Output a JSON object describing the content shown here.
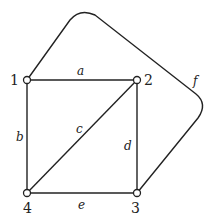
{
  "graph": {
    "nodes": [
      {
        "id": "1",
        "label": "1"
      },
      {
        "id": "2",
        "label": "2"
      },
      {
        "id": "3",
        "label": "3"
      },
      {
        "id": "4",
        "label": "4"
      }
    ],
    "edges": [
      {
        "id": "a",
        "label": "a",
        "from": "1",
        "to": "2"
      },
      {
        "id": "b",
        "label": "b",
        "from": "1",
        "to": "4"
      },
      {
        "id": "c",
        "label": "c",
        "from": "2",
        "to": "4"
      },
      {
        "id": "d",
        "label": "d",
        "from": "2",
        "to": "3"
      },
      {
        "id": "e",
        "label": "e",
        "from": "4",
        "to": "3"
      },
      {
        "id": "f",
        "label": "f",
        "from": "1",
        "to": "3"
      }
    ]
  }
}
